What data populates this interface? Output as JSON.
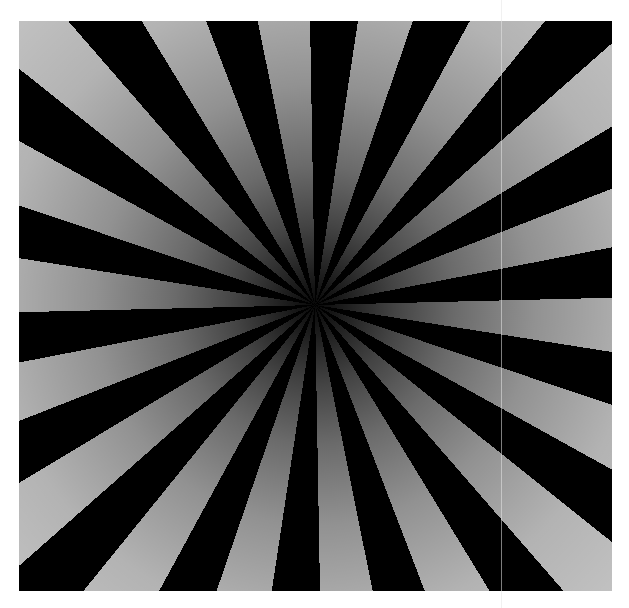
{
  "image": {
    "subject": "radial sunburst star pattern",
    "description": "Alternating black and light-gray radial wedges converging at a dark center, light wedges darkening toward the center",
    "ray_count": 36,
    "wedge_angle_deg": 10,
    "center": {
      "x": 315,
      "y": 305
    },
    "pattern_bounds": {
      "left": 19,
      "top": 21,
      "right": 612,
      "bottom": 591
    },
    "colors": {
      "background": "#ffffff",
      "dark_ray": "#000000",
      "light_ray_edge": "#c2c2c2",
      "center": "#0a0a0a",
      "artifact_line": "#e6e6e6"
    },
    "artifact": {
      "type": "vertical-line",
      "x": 501
    }
  }
}
